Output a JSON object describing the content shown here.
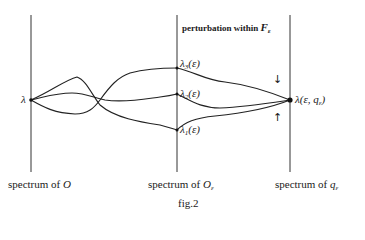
{
  "figure": {
    "caption": "fig.2",
    "top_label": {
      "prefix": "perturbation within ",
      "symbol": "F",
      "subscript": "ε"
    },
    "columns": [
      {
        "id": "O",
        "label_prefix": "spectrum of ",
        "symbol": "O",
        "subscript": ""
      },
      {
        "id": "O_eps",
        "label_prefix": "spectrum of ",
        "symbol": "O",
        "subscript": "ε"
      },
      {
        "id": "q_eps",
        "label_prefix": "spectrum of ",
        "symbol": "q",
        "subscript": "ε"
      }
    ],
    "points": {
      "left": {
        "symbol": "λ"
      },
      "lambda3": {
        "text": "λ",
        "index": "3",
        "arg": "(ε)"
      },
      "lambda2": {
        "text": "λ",
        "index": "2",
        "arg": "(ε)"
      },
      "lambda1": {
        "text": "λ",
        "index": "1",
        "arg": "(ε)"
      },
      "right": {
        "text": "λ(ε, q",
        "subscript": "ε",
        "close": ")"
      }
    },
    "arrows": {
      "down": "↓",
      "up": "↑"
    }
  }
}
